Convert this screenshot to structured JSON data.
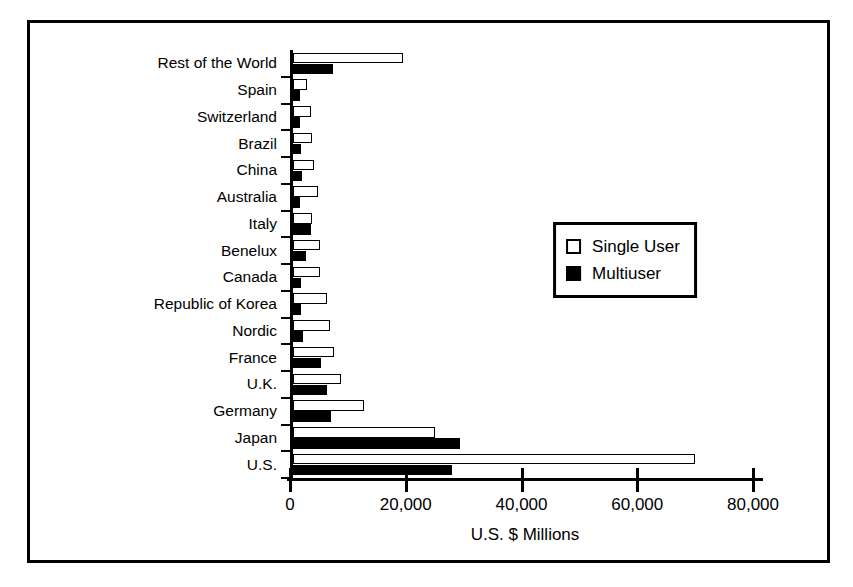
{
  "chart_data": {
    "type": "bar",
    "orientation": "horizontal",
    "title": "",
    "xlabel": "U.S. $ Millions",
    "ylabel": "",
    "xlim": [
      0,
      80000
    ],
    "xticks": [
      "0",
      "20,000",
      "40,000",
      "60,000",
      "80,000"
    ],
    "xtick_values": [
      0,
      20000,
      40000,
      60000,
      80000
    ],
    "grid": false,
    "legend_position": "center-right",
    "categories": [
      "Rest of the World",
      "Spain",
      "Switzerland",
      "Brazil",
      "China",
      "Australia",
      "Italy",
      "Benelux",
      "Canada",
      "Republic of Korea",
      "Nordic",
      "France",
      "U.K.",
      "Germany",
      "Japan",
      "U.S."
    ],
    "series": [
      {
        "name": "Single User",
        "fill": "#ffffff",
        "values": [
          19000,
          2400,
          3100,
          3300,
          3600,
          4300,
          3300,
          4700,
          4700,
          5900,
          6400,
          7100,
          8300,
          12300,
          24500,
          69500
        ]
      },
      {
        "name": "Multiuser",
        "fill": "#000000",
        "values": [
          6900,
          1200,
          1200,
          1400,
          1550,
          1200,
          3100,
          2300,
          1400,
          1400,
          1700,
          4800,
          5900,
          6600,
          28800,
          27500
        ]
      }
    ]
  },
  "legend": {
    "entries": [
      {
        "label": "Single User",
        "style": "single"
      },
      {
        "label": "Multiuser",
        "style": "multi"
      }
    ]
  },
  "colors": {
    "single_user": "#ffffff",
    "multiuser": "#000000",
    "axis": "#000000",
    "background": "#ffffff"
  }
}
